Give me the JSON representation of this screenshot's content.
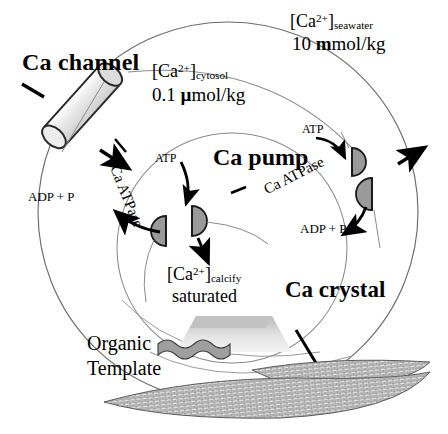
{
  "figure": {
    "type": "biological-process-diagram"
  },
  "labels": {
    "ca_channel": "Ca channel",
    "ca_pump": "Ca pump",
    "ca_crystal": "Ca crystal",
    "organic": "Organic",
    "template": "Template",
    "atpase_left": "Ca ATPase",
    "atpase_right": "Ca ATPase",
    "atp_left": "ATP",
    "atp_right": "ATP",
    "adp_left": "ADP + P",
    "adp_right": "ADP + P"
  },
  "concentrations": {
    "cytosol": {
      "species": "Ca",
      "charge": "2+",
      "compartment": "cytosol",
      "value": "0.1",
      "unit_bold": "µ",
      "unit_rest": "mol/kg",
      "full": "0.1 µmol/kg"
    },
    "seawater": {
      "species": "Ca",
      "charge": "2+",
      "compartment": "seawater",
      "value": "10",
      "unit_bold": "m",
      "unit_rest": "mol/kg",
      "full": "10 mmol/kg"
    },
    "calcify": {
      "species": "Ca",
      "charge": "2+",
      "compartment": "calcify",
      "state": "saturated"
    }
  },
  "brackets": {
    "open": "[",
    "close": "]"
  },
  "colors": {
    "pump_fill": "#9a9a9a",
    "pump_stroke": "#1a1a1a",
    "channel_fill": "#e2e2e2",
    "channel_stroke": "#2a2a2a",
    "arc_stroke": "#6b6b6b",
    "arrow": "#000000",
    "crystal_fill": "#d8d8d8",
    "template_fill": "#9f9f9f",
    "background": "#ffffff"
  }
}
